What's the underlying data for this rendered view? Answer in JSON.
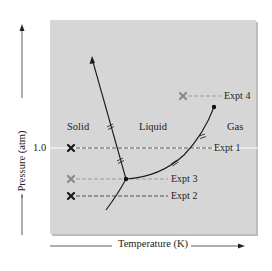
{
  "diagram": {
    "type": "phase diagram",
    "axes": {
      "y_label": "Pressure (atm)",
      "x_label": "Temperature (K)",
      "y_tick": "1.0"
    },
    "regions": {
      "solid": "Solid",
      "liquid": "Liquid",
      "gas": "Gas"
    },
    "experiments": [
      {
        "label": "Expt 1",
        "marker": "x",
        "marker_color": "#1a1a1a",
        "line": "dashed"
      },
      {
        "label": "Expt 2",
        "marker": "x",
        "marker_color": "#1a1a1a",
        "line": "dashed"
      },
      {
        "label": "Expt 3",
        "marker": "x",
        "marker_color": "#8a8a8a",
        "line": "dashed"
      },
      {
        "label": "Expt 4",
        "marker": "x",
        "marker_color": "#8a8a8a",
        "line": "dashed"
      }
    ],
    "points": {
      "triple_point": "triple point",
      "critical_point": "critical point"
    },
    "colors": {
      "panel": "#d6d6d6",
      "curve": "#1a1a1a",
      "dark_line": "#555555",
      "light_line": "#9a9a9a",
      "reference_line": "#ffffff"
    }
  }
}
